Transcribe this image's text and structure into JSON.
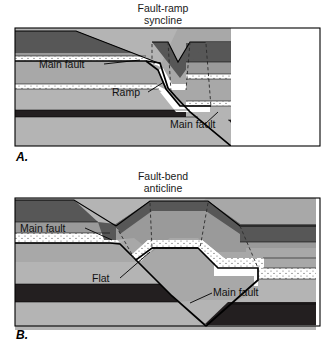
{
  "figure": {
    "kind": "geologic-cross-section-pair",
    "background": "#ffffff"
  },
  "panels": [
    {
      "id": "A",
      "letter": "A.",
      "title_line1": "Fault-ramp",
      "title_line2": "syncline",
      "labels": [
        {
          "id": "main-fault-upper",
          "text": "Main fault"
        },
        {
          "id": "ramp",
          "text": "Ramp"
        },
        {
          "id": "main-fault-lower",
          "text": "Main fault"
        }
      ]
    },
    {
      "id": "B",
      "letter": "B.",
      "title_line1": "Fault-bend",
      "title_line2": "anticline",
      "labels": [
        {
          "id": "main-fault-upper",
          "text": "Main fault"
        },
        {
          "id": "flat",
          "text": "Flat"
        },
        {
          "id": "main-fault-lower",
          "text": "Main fault"
        }
      ]
    }
  ],
  "palette": {
    "dark_gray": "#575757",
    "medium_gray": "#9a9a9a",
    "light_gray": "#b4b4b4",
    "pale_gray": "#a8a8a8",
    "white_bed": "#ffffff",
    "near_black": "#231f20",
    "stipple_dot": "#4a4a4a",
    "outline": "#000000",
    "text": "#111111"
  },
  "legend_beds": [
    {
      "name": "upper-dark-unit",
      "color": "#575757"
    },
    {
      "name": "upper-gray-unit",
      "color": "#9a9a9a"
    },
    {
      "name": "white-marker-bed-1",
      "color": "#ffffff"
    },
    {
      "name": "middle-gray-unit",
      "color": "#a8a8a8"
    },
    {
      "name": "white-marker-bed-2",
      "color": "#ffffff"
    },
    {
      "name": "lower-gray-unit",
      "color": "#b4b4b4"
    },
    {
      "name": "black-marker-bed",
      "color": "#231f20"
    },
    {
      "name": "basal-gray-unit",
      "color": "#b4b4b4"
    }
  ]
}
